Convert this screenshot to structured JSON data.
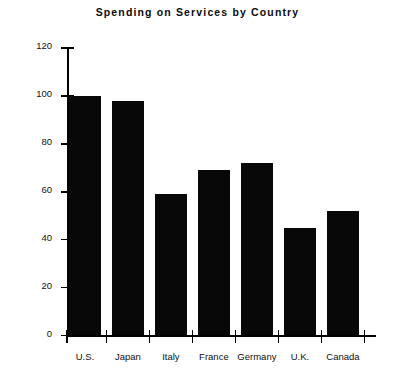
{
  "chart_data": {
    "type": "bar",
    "title": "Spending on Services by Country",
    "xlabel": "",
    "ylabel": "Per Person Relative to U.S.",
    "categories": [
      "U.S.",
      "Japan",
      "Italy",
      "France",
      "Germany",
      "U.K.",
      "Canada"
    ],
    "values": [
      100,
      98,
      59,
      69,
      72,
      45,
      52
    ],
    "ylim": [
      0,
      120
    ],
    "ytick_labels": [
      "0",
      "20",
      "40",
      "60",
      "80",
      "100",
      "120"
    ],
    "ytick_values": [
      0,
      20,
      40,
      60,
      80,
      100,
      120
    ],
    "grid": false,
    "legend": false,
    "bar_color": "#080808",
    "axis_color": "#000000",
    "background_color": "#ffffff"
  }
}
